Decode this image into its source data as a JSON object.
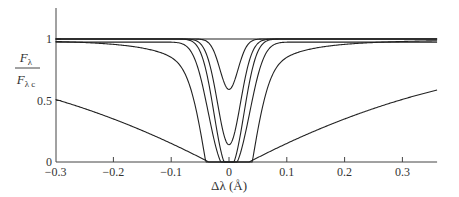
{
  "chart_data": {
    "type": "line",
    "title": "",
    "xlabel": "Δλ (Å)",
    "ylabel_numerator": "F",
    "ylabel_numerator_sub": "λ",
    "ylabel_denominator": "F",
    "ylabel_denominator_sub": "λ c",
    "xlim": [
      -0.3,
      0.36
    ],
    "ylim": [
      0,
      1.25
    ],
    "xticks": [
      -0.3,
      -0.2,
      -0.1,
      0,
      0.1,
      0.2,
      0.3
    ],
    "xtick_labels": [
      "−0.3",
      "−0.2",
      "−0.1",
      "0",
      "0.1",
      "0.2",
      "0.3"
    ],
    "yticks": [
      0,
      0.5,
      1
    ],
    "ytick_labels": [
      "0",
      "0.5",
      "1"
    ],
    "grid": false,
    "legend": null,
    "series": [
      {
        "name": "continuum",
        "description": "flat line at 1.0",
        "depth": 0.0,
        "width": 0.0
      },
      {
        "name": "line-1",
        "description": "weak line, min ≈ 0.59",
        "depth": 0.41,
        "width": 0.022,
        "wing": 0.025
      },
      {
        "name": "line-2",
        "description": "min ≈ 0.14",
        "depth": 0.86,
        "width": 0.028,
        "wing": 0.03
      },
      {
        "name": "line-3",
        "description": "saturated, min 0",
        "depth": 1.0,
        "width": 0.034,
        "wing": 0.035
      },
      {
        "name": "line-4",
        "description": "saturated, min 0, wing dip ≈ 0.975 at edges",
        "depth": 1.0,
        "width": 0.042,
        "wing": 0.05
      },
      {
        "name": "line-5",
        "description": "saturated, broad wings, ≈0.92 at -0.3",
        "depth": 1.0,
        "width": 0.05,
        "wing": 0.11
      },
      {
        "name": "line-6",
        "description": "strongly saturated, very broad damping wings, ≈0.60 at -0.3, ≈0.64 at 0.36",
        "depth": 1.0,
        "width": 0.06,
        "wing": 0.32
      }
    ]
  }
}
